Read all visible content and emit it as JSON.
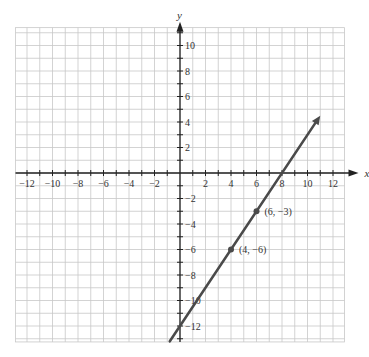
{
  "chart_data": {
    "type": "line",
    "title": "",
    "xlabel": "x",
    "ylabel": "y",
    "xlim": [
      -12.9,
      12.9
    ],
    "ylim": [
      -13.25,
      11.4
    ],
    "grid": true,
    "legend": null,
    "x_ticks": [
      -12,
      -10,
      -8,
      -6,
      -4,
      -2,
      2,
      4,
      6,
      8,
      10,
      12
    ],
    "y_ticks": [
      -12,
      -10,
      -8,
      -6,
      -4,
      -2,
      2,
      4,
      6,
      8,
      10
    ],
    "x_tick_labels": [
      "−12",
      "−10",
      "−8",
      "−6",
      "−4",
      "−2",
      "2",
      "4",
      "6",
      "8",
      "10",
      "12"
    ],
    "y_tick_labels": [
      "−12",
      "−10",
      "−8",
      "−6",
      "−4",
      "−2",
      "2",
      "4",
      "6",
      "8",
      "10"
    ],
    "series": [
      {
        "name": "line",
        "equation": "y = 1.5x - 12",
        "x": [
          -0.8,
          11
        ],
        "y": [
          -13.2,
          4.5
        ],
        "arrow_end": true,
        "color": "#4a4a4a"
      }
    ],
    "points": [
      {
        "x": 6,
        "y": -3,
        "label": "(6, −3)"
      },
      {
        "x": 4,
        "y": -6,
        "label": "(4, −6)"
      }
    ]
  },
  "colors": {
    "grid": "#c8c8c8",
    "axis": "#222222",
    "line": "#4a4a4a",
    "text": "#333333"
  },
  "layout": {
    "origin_px": [
      180,
      173
    ],
    "unit_px": 12.75
  }
}
